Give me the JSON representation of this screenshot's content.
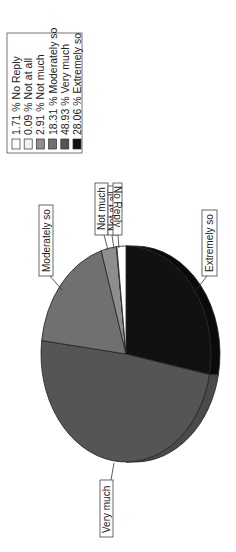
{
  "chart_data": {
    "type": "pie",
    "title": "",
    "orientation": "rotated-90-counterclockwise",
    "style": "3d-pie",
    "legend_position": "top-left (rotated)",
    "slices": [
      {
        "label": "No Reply",
        "value": 1.71,
        "legend": "1.71 % No Reply",
        "color": "#ffffff"
      },
      {
        "label": "Not at all",
        "value": 0.09,
        "legend": "0.09 % Not at all",
        "color": "#f4f4f4"
      },
      {
        "label": "Not much",
        "value": 2.91,
        "legend": "2.91 % Not much",
        "color": "#8e8e8e"
      },
      {
        "label": "Moderately so",
        "value": 18.31,
        "legend": "18.31 % Moderately so",
        "color": "#707070"
      },
      {
        "label": "Very much",
        "value": 48.93,
        "legend": "48.93 % Very much",
        "color": "#555555"
      },
      {
        "label": "Extremely so",
        "value": 28.06,
        "legend": "28.06 % Extremely so",
        "color": "#111111"
      }
    ],
    "categories": [
      "No Reply",
      "Not at all",
      "Not much",
      "Moderately so",
      "Very much",
      "Extremely so"
    ],
    "values": [
      1.71,
      0.09,
      2.91,
      18.31,
      48.93,
      28.06
    ],
    "unit": "%"
  },
  "legend": {
    "items": [
      "1.71 % No Reply",
      "0.09 % Not at all",
      "2.91 % Not much",
      "18.31 % Moderately so",
      "48.93 % Very much",
      "28.06 % Extremely so"
    ]
  },
  "labels": {
    "no_reply": "No Reply",
    "not_at_all": "Not at all",
    "not_much": "Not much",
    "moderately_so": "Moderately so",
    "very_much": "Very much",
    "extremely_so": "Extremely so"
  }
}
